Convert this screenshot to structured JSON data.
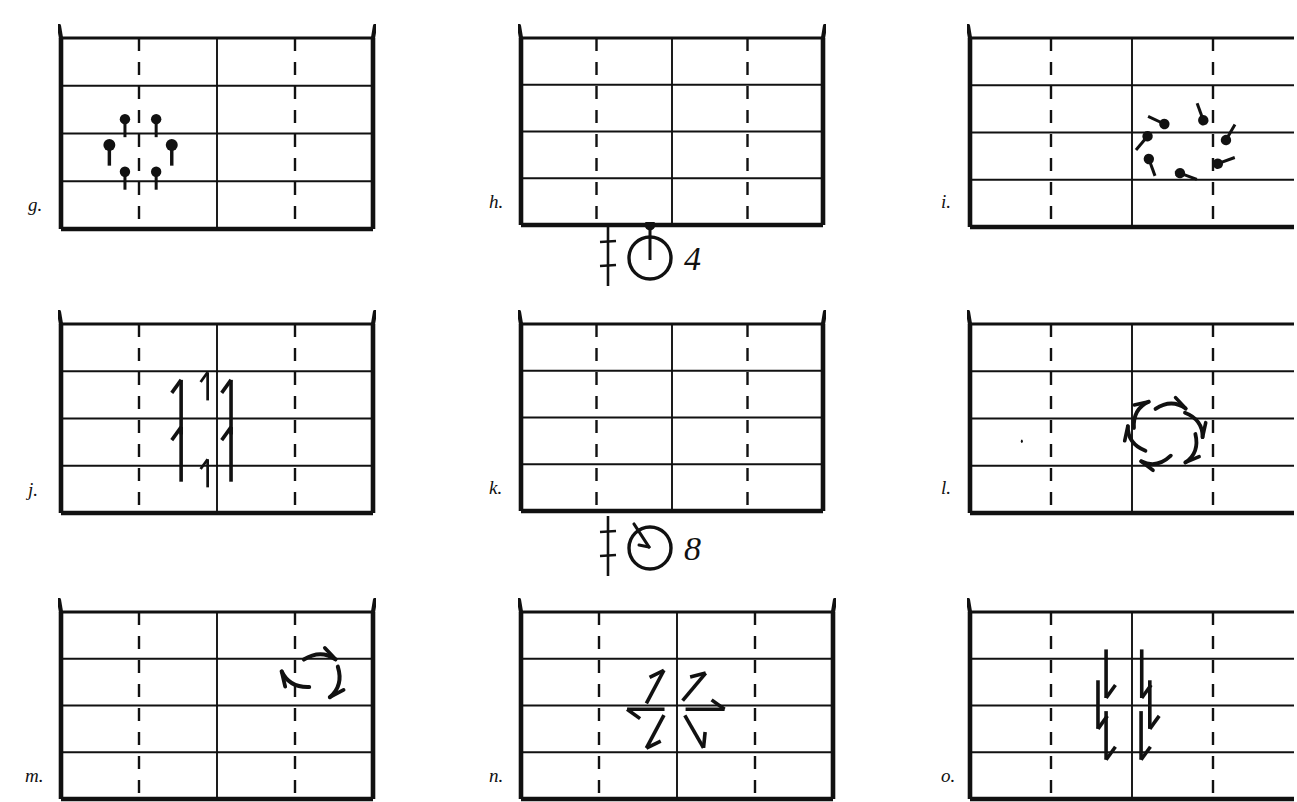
{
  "document": {
    "kind": "dance-notation-worksheet",
    "background_color": "#ffffff",
    "ink_color": "#111111",
    "width": 1278,
    "height": 799
  },
  "grid_layout": {
    "columns": 3,
    "rows": 3,
    "panel_rows": 4,
    "panel_columns": 4,
    "center_vertical_line": "solid",
    "quarter_vertical_lines": "dashed",
    "horizontal_lines": "solid",
    "corner_flare": "diagonal tick at top corners"
  },
  "panels": [
    {
      "id": "g",
      "label": "g.",
      "x": 58,
      "y": 24,
      "w": 318,
      "h": 190,
      "label_x": 28,
      "label_y": 195,
      "clipped_right": false,
      "content_name": "six-pin-hexagon-cluster",
      "content_description": "Six pin symbols (filled round head with straight downward tail) arranged in a hexagon around the left-of-centre intersection",
      "marks": [
        {
          "type": "pin",
          "cx": 0.205,
          "cy": 0.425,
          "tail_angle": 90,
          "size": 1.0
        },
        {
          "type": "pin",
          "cx": 0.305,
          "cy": 0.425,
          "tail_angle": 90,
          "size": 1.0
        },
        {
          "type": "pin",
          "cx": 0.155,
          "cy": 0.56,
          "tail_angle": 90,
          "size": 1.15
        },
        {
          "type": "pin",
          "cx": 0.355,
          "cy": 0.56,
          "tail_angle": 90,
          "size": 1.15
        },
        {
          "type": "pin",
          "cx": 0.205,
          "cy": 0.7,
          "tail_angle": 90,
          "size": 1.0
        },
        {
          "type": "pin",
          "cx": 0.305,
          "cy": 0.7,
          "tail_angle": 90,
          "size": 1.0
        }
      ]
    },
    {
      "id": "h",
      "label": "h.",
      "x": 518,
      "y": 24,
      "w": 308,
      "h": 186,
      "label_x": 489,
      "label_y": 192,
      "clipped_right": false,
      "content_name": "empty-floor-plan",
      "content_description": "Empty grid, no marks",
      "marks": []
    },
    {
      "id": "i",
      "label": "i.",
      "x": 967,
      "y": 24,
      "w": 330,
      "h": 188,
      "label_x": 941,
      "label_y": 192,
      "clipped_right": true,
      "content_name": "seven-pin-clockwise-circle",
      "content_description": "Seven pin symbols arranged on a circle, each tail rotated tangentially indicating clockwise rotation",
      "marks": [
        {
          "type": "pin",
          "cx": 0.6,
          "cy": 0.455,
          "tail_angle": 205,
          "size": 1.0
        },
        {
          "type": "pin",
          "cx": 0.72,
          "cy": 0.435,
          "tail_angle": 250,
          "size": 1.0
        },
        {
          "type": "pin",
          "cx": 0.79,
          "cy": 0.54,
          "tail_angle": 300,
          "size": 1.0
        },
        {
          "type": "pin",
          "cx": 0.765,
          "cy": 0.665,
          "tail_angle": 340,
          "size": 1.0
        },
        {
          "type": "pin",
          "cx": 0.648,
          "cy": 0.715,
          "tail_angle": 20,
          "size": 1.0
        },
        {
          "type": "pin",
          "cx": 0.552,
          "cy": 0.64,
          "tail_angle": 70,
          "size": 1.0
        },
        {
          "type": "pin",
          "cx": 0.548,
          "cy": 0.52,
          "tail_angle": 130,
          "size": 1.0
        }
      ]
    },
    {
      "id": "j",
      "label": "j.",
      "x": 58,
      "y": 310,
      "w": 318,
      "h": 188,
      "label_x": 28,
      "label_y": 480,
      "clipped_right": false,
      "content_name": "six-forward-arrows",
      "content_description": "Six straight arrows pointing up (forward), four large plus two short ones on the centre line",
      "marks": [
        {
          "type": "arrow",
          "cx": 0.385,
          "cy": 0.44,
          "angle": -90,
          "len": 0.175,
          "size": 1.0
        },
        {
          "type": "arrow",
          "cx": 0.545,
          "cy": 0.44,
          "angle": -90,
          "len": 0.175,
          "size": 1.0
        },
        {
          "type": "arrow",
          "cx": 0.385,
          "cy": 0.69,
          "angle": -90,
          "len": 0.175,
          "size": 1.0
        },
        {
          "type": "arrow",
          "cx": 0.545,
          "cy": 0.69,
          "angle": -90,
          "len": 0.175,
          "size": 1.0
        },
        {
          "type": "arrow",
          "cx": 0.47,
          "cy": 0.33,
          "angle": -90,
          "len": 0.09,
          "size": 0.75
        },
        {
          "type": "arrow",
          "cx": 0.47,
          "cy": 0.79,
          "angle": -90,
          "len": 0.09,
          "size": 0.75
        }
      ]
    },
    {
      "id": "k",
      "label": "k.",
      "x": 518,
      "y": 310,
      "w": 308,
      "h": 186,
      "label_x": 489,
      "label_y": 478,
      "clipped_right": false,
      "content_name": "empty-floor-plan",
      "content_description": "Empty grid, no marks",
      "marks": []
    },
    {
      "id": "l",
      "label": "l.",
      "x": 967,
      "y": 310,
      "w": 330,
      "h": 188,
      "label_x": 941,
      "label_y": 478,
      "clipped_right": true,
      "content_name": "six-curved-arrows-clockwise-ring",
      "content_description": "Six curved arrows on a ring indicating clockwise circular travel; a small stray ink dot at left",
      "marks": [
        {
          "type": "curved-arrow",
          "cx": 0.52,
          "cy": 0.47,
          "angle": -55,
          "size": 1.0
        },
        {
          "type": "curved-arrow",
          "cx": 0.62,
          "cy": 0.43,
          "angle": 5,
          "size": 1.0
        },
        {
          "type": "curved-arrow",
          "cx": 0.7,
          "cy": 0.525,
          "angle": 60,
          "size": 1.0
        },
        {
          "type": "curved-arrow",
          "cx": 0.69,
          "cy": 0.665,
          "angle": 115,
          "size": 1.0
        },
        {
          "type": "curved-arrow",
          "cx": 0.575,
          "cy": 0.73,
          "angle": 175,
          "size": 1.0
        },
        {
          "type": "curved-arrow",
          "cx": 0.505,
          "cy": 0.615,
          "angle": 240,
          "size": 1.0
        },
        {
          "type": "dot",
          "cx": 0.16,
          "cy": 0.62,
          "size": 0.5
        }
      ]
    },
    {
      "id": "m",
      "label": "m.",
      "x": 58,
      "y": 598,
      "w": 318,
      "h": 186,
      "label_x": 25,
      "label_y": 766,
      "clipped_right": false,
      "content_name": "three-curved-arrows-upper-right",
      "content_description": "Three curved arrow strokes grouped in the upper right area forming a partial ring",
      "marks": [
        {
          "type": "curved-arrow",
          "cx": 0.83,
          "cy": 0.235,
          "angle": 5,
          "size": 1.05
        },
        {
          "type": "curved-arrow",
          "cx": 0.745,
          "cy": 0.375,
          "angle": 215,
          "size": 1.05
        },
        {
          "type": "curved-arrow",
          "cx": 0.885,
          "cy": 0.38,
          "angle": 110,
          "size": 1.05
        }
      ]
    },
    {
      "id": "n",
      "label": "n.",
      "x": 518,
      "y": 598,
      "w": 318,
      "h": 186,
      "label_x": 489,
      "label_y": 766,
      "clipped_right": false,
      "content_name": "six-arrows-radiating-outward",
      "content_description": "Six straight arrows radiating outward from the centre in a starburst",
      "marks": [
        {
          "type": "arrow",
          "cx": 0.43,
          "cy": 0.4,
          "angle": -62,
          "len": 0.12,
          "size": 1.0
        },
        {
          "type": "arrow",
          "cx": 0.555,
          "cy": 0.4,
          "angle": -50,
          "len": 0.115,
          "size": 1.0
        },
        {
          "type": "arrow",
          "cx": 0.4,
          "cy": 0.52,
          "angle": 180,
          "len": 0.12,
          "size": 1.0
        },
        {
          "type": "arrow",
          "cx": 0.59,
          "cy": 0.52,
          "angle": 0,
          "len": 0.125,
          "size": 1.0
        },
        {
          "type": "arrow",
          "cx": 0.43,
          "cy": 0.64,
          "angle": 118,
          "len": 0.12,
          "size": 1.0
        },
        {
          "type": "arrow",
          "cx": 0.555,
          "cy": 0.64,
          "angle": 60,
          "len": 0.12,
          "size": 1.0
        }
      ]
    },
    {
      "id": "o",
      "label": "o.",
      "x": 967,
      "y": 598,
      "w": 330,
      "h": 186,
      "label_x": 941,
      "label_y": 766,
      "clipped_right": true,
      "content_name": "six-backward-arrows-two-columns",
      "content_description": "Six straight arrows pointing down (backward) in two staggered columns of three",
      "marks": [
        {
          "type": "arrow",
          "cx": 0.42,
          "cy": 0.33,
          "angle": 90,
          "len": 0.15,
          "size": 1.0
        },
        {
          "type": "arrow",
          "cx": 0.53,
          "cy": 0.33,
          "angle": 90,
          "len": 0.15,
          "size": 1.0
        },
        {
          "type": "arrow",
          "cx": 0.395,
          "cy": 0.495,
          "angle": 90,
          "len": 0.15,
          "size": 1.0
        },
        {
          "type": "arrow",
          "cx": 0.555,
          "cy": 0.495,
          "angle": 90,
          "len": 0.15,
          "size": 1.0
        },
        {
          "type": "arrow",
          "cx": 0.42,
          "cy": 0.66,
          "angle": 90,
          "len": 0.15,
          "size": 1.0
        },
        {
          "type": "arrow",
          "cx": 0.528,
          "cy": 0.66,
          "angle": 90,
          "len": 0.15,
          "size": 1.0
        }
      ]
    }
  ],
  "notation_symbols": [
    {
      "id": "symbol-4",
      "name": "pin-in-circle-with-count-4",
      "x": 596,
      "y": 222,
      "w": 130,
      "h": 66,
      "staff_line": "vertical line with two horizontal cross ticks",
      "circle_mark": "circle with a pin (stem and filled head) rising from its top",
      "count": "4"
    },
    {
      "id": "symbol-8",
      "name": "pin-in-circle-with-count-8",
      "x": 596,
      "y": 512,
      "w": 130,
      "h": 66,
      "staff_line": "vertical line with two horizontal cross ticks",
      "circle_mark": "circle with a short stroke angled across its upper left",
      "count": "8"
    }
  ]
}
